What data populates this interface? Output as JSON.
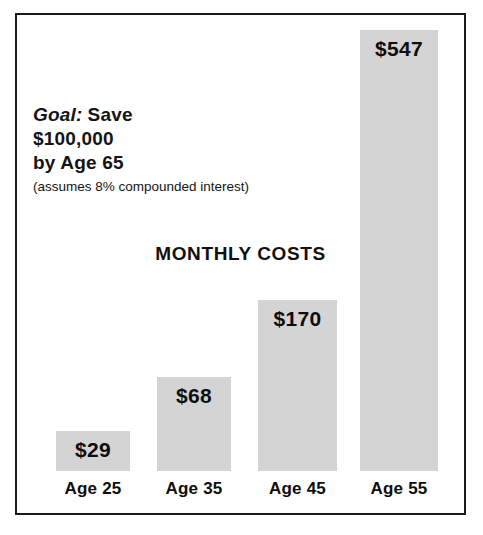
{
  "chart_data": {
    "type": "bar",
    "title": "MONTHLY COSTS",
    "xlabel": "",
    "ylabel": "",
    "categories": [
      "Age 25",
      "Age 35",
      "Age 45",
      "Age 55"
    ],
    "values": [
      29,
      68,
      170,
      547
    ],
    "value_labels": [
      "$29",
      "$68",
      "$170",
      "$547"
    ],
    "value_prefix": "$",
    "ylim": [
      0,
      547
    ],
    "grid": false,
    "legend": null,
    "bar_color": "#d4d4d4",
    "text_color": "#0d0d0d",
    "background_color": "#ffffff",
    "border_color": "#1a1a1a",
    "annotations": [
      {
        "id": "goal",
        "kicker": "Goal:",
        "line1": "Save",
        "line2": "$100,000",
        "line3": "by Age 65",
        "note": "(assumes 8% compounded interest)"
      }
    ]
  },
  "figure": {
    "title": "MONTHLY COSTS",
    "goal": {
      "kicker": "Goal:",
      "line1": "Save",
      "line2": "$100,000",
      "line3": "by Age 65",
      "note": "(assumes 8% compounded interest)"
    }
  },
  "bars": [
    {
      "category": "Age 25",
      "label": "$29",
      "value": 29,
      "left": 39,
      "width": 74,
      "height": 40
    },
    {
      "category": "Age 35",
      "label": "$68",
      "value": 68,
      "left": 140,
      "width": 74,
      "height": 94
    },
    {
      "category": "Age 45",
      "label": "$170",
      "value": 170,
      "left": 241,
      "width": 79,
      "height": 171
    },
    {
      "category": "Age 55",
      "label": "$547",
      "value": 547,
      "left": 343,
      "width": 78,
      "height": 441
    }
  ]
}
